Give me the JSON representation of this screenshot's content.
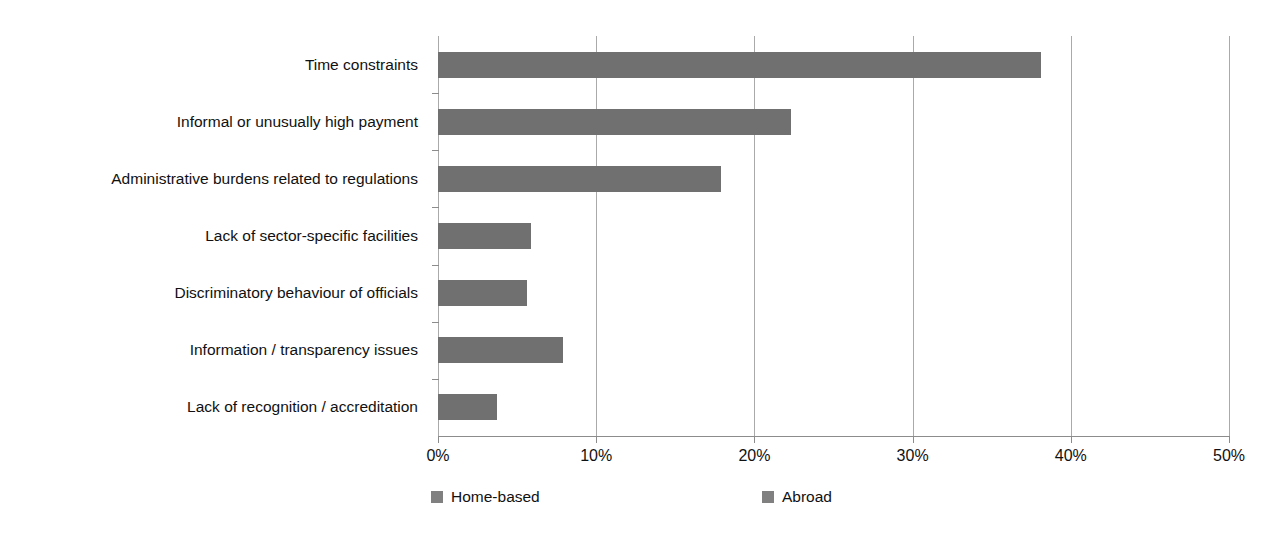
{
  "chart_data": {
    "type": "bar",
    "orientation": "horizontal",
    "title": "",
    "subtitle": "",
    "xlabel": "",
    "ylabel": "",
    "xlim": [
      0,
      50
    ],
    "xunit": "%",
    "grid": true,
    "grid_axis": "x",
    "legend_position": "bottom",
    "bar_color": "#707070",
    "categories": [
      "Time constraints",
      "Informal or unusually high payment",
      "Administrative burdens related to regulations",
      "Lack of sector-specific facilities",
      "Discriminatory behaviour of officials",
      "Information / transparency issues",
      "Lack of recognition / accreditation"
    ],
    "series": [
      {
        "name": "Home-based",
        "color": "#707070",
        "values": [
          38.1,
          22.3,
          17.9,
          5.9,
          5.6,
          7.9,
          3.7
        ]
      },
      {
        "name": "Abroad",
        "color": "#808080",
        "values": [
          0,
          0,
          0,
          0,
          0,
          0,
          0
        ]
      }
    ],
    "xticks": [
      0,
      10,
      20,
      30,
      40,
      50
    ],
    "xticklabels": [
      "0%",
      "10%",
      "20%",
      "30%",
      "40%",
      "50%"
    ]
  },
  "legend": {
    "items": [
      {
        "label": "Home-based",
        "color": "#808080"
      },
      {
        "label": "Abroad",
        "color": "#808080"
      }
    ]
  }
}
